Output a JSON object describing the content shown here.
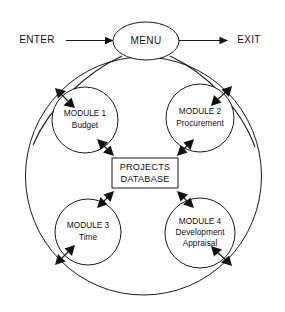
{
  "diagram": {
    "type": "block-flow-diagram",
    "colors": {
      "stroke": "#1a1a1a",
      "background": "#ffffff",
      "text": "#111111"
    },
    "io": {
      "enter_label": "ENTER",
      "exit_label": "EXIT"
    },
    "menu": {
      "label": "MENU"
    },
    "database": {
      "line1": "PROJECTS",
      "line2": "DATABASE"
    },
    "modules": [
      {
        "id": "module-1",
        "line1": "MODULE 1",
        "line2": "Budget",
        "line3": ""
      },
      {
        "id": "module-2",
        "line1": "MODULE 2",
        "line2": "Procurement",
        "line3": ""
      },
      {
        "id": "module-3",
        "line1": "MODULE 3",
        "line2": "Time",
        "line3": ""
      },
      {
        "id": "module-4",
        "line1": "MODULE 4",
        "line2": "Development",
        "line3": "Appraisal"
      }
    ]
  }
}
